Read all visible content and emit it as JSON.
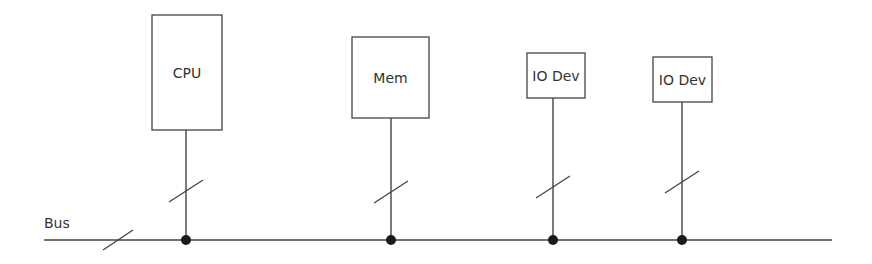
{
  "diagram": {
    "colors": {
      "line": "#444444",
      "dot": "#1a1a1a",
      "text": "#333333",
      "background": "#ffffff"
    },
    "bus": {
      "label": "Bus",
      "y": 240,
      "x1": 44,
      "x2": 832,
      "label_x": 44,
      "label_y": 228,
      "slash": {
        "x": 118,
        "y": 240
      }
    },
    "components": [
      {
        "id": "cpu",
        "label": "CPU",
        "x": 152,
        "y": 15,
        "w": 70,
        "h": 115,
        "line_x": 186,
        "slash_y": 191
      },
      {
        "id": "mem",
        "label": "Mem",
        "x": 352,
        "y": 37,
        "w": 77,
        "h": 81,
        "line_x": 391,
        "slash_y": 192
      },
      {
        "id": "io1",
        "label": "IO Dev",
        "x": 527,
        "y": 53,
        "w": 58,
        "h": 45,
        "line_x": 553,
        "slash_y": 187
      },
      {
        "id": "io2",
        "label": "IO Dev",
        "x": 653,
        "y": 57,
        "w": 59,
        "h": 45,
        "line_x": 682,
        "slash_y": 182
      }
    ]
  }
}
